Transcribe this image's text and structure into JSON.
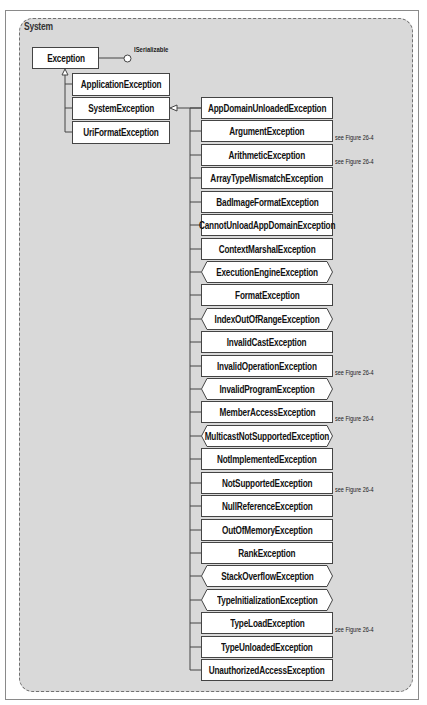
{
  "diagram": {
    "namespace": "System",
    "root": {
      "name": "Exception",
      "interface": "ISerializable"
    },
    "level1": [
      {
        "name": "ApplicationException"
      },
      {
        "name": "SystemException"
      },
      {
        "name": "UriFormatException"
      }
    ],
    "system_exception_children": [
      {
        "name": "AppDomainUnloadedException",
        "sealed": false,
        "note": ""
      },
      {
        "name": "ArgumentException",
        "sealed": false,
        "note": "see Figure 26-4"
      },
      {
        "name": "ArithmeticException",
        "sealed": false,
        "note": "see Figure 26-4"
      },
      {
        "name": "ArrayTypeMismatchException",
        "sealed": false,
        "note": ""
      },
      {
        "name": "BadImageFormatException",
        "sealed": false,
        "note": ""
      },
      {
        "name": "CannotUnloadAppDomainException",
        "sealed": false,
        "note": ""
      },
      {
        "name": "ContextMarshalException",
        "sealed": false,
        "note": ""
      },
      {
        "name": "ExecutionEngineException",
        "sealed": true,
        "note": ""
      },
      {
        "name": "FormatException",
        "sealed": false,
        "note": ""
      },
      {
        "name": "IndexOutOfRangeException",
        "sealed": true,
        "note": ""
      },
      {
        "name": "InvalidCastException",
        "sealed": false,
        "note": ""
      },
      {
        "name": "InvalidOperationException",
        "sealed": false,
        "note": "see Figure 26-4"
      },
      {
        "name": "InvalidProgramException",
        "sealed": true,
        "note": ""
      },
      {
        "name": "MemberAccessException",
        "sealed": false,
        "note": "see Figure 26-4"
      },
      {
        "name": "MulticastNotSupportedException",
        "sealed": true,
        "note": ""
      },
      {
        "name": "NotImplementedException",
        "sealed": false,
        "note": ""
      },
      {
        "name": "NotSupportedException",
        "sealed": false,
        "note": "see Figure 26-4"
      },
      {
        "name": "NullReferenceException",
        "sealed": false,
        "note": ""
      },
      {
        "name": "OutOfMemoryException",
        "sealed": false,
        "note": ""
      },
      {
        "name": "RankException",
        "sealed": false,
        "note": ""
      },
      {
        "name": "StackOverflowException",
        "sealed": true,
        "note": ""
      },
      {
        "name": "TypeInitializationException",
        "sealed": true,
        "note": ""
      },
      {
        "name": "TypeLoadException",
        "sealed": false,
        "note": "see Figure 26-4"
      },
      {
        "name": "TypeUnloadedException",
        "sealed": false,
        "note": ""
      },
      {
        "name": "UnauthorizedAccessException",
        "sealed": false,
        "note": ""
      }
    ],
    "colors": {
      "panel_fill": "#d9d9d9",
      "panel_border": "#707070",
      "box_fill": "#ffffff",
      "line": "#444444"
    }
  }
}
